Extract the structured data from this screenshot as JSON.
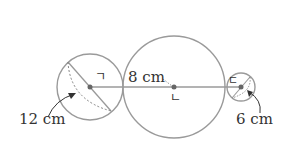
{
  "diagram": {
    "labels": {
      "left_diameter": "12 cm",
      "middle_distance": "8 cm",
      "right_diameter": "6 cm",
      "point_a": "ㄱ",
      "point_b": "ㄴ",
      "point_c": "ㄷ"
    },
    "circles": [
      {
        "name": "left-sphere",
        "cx": 90,
        "cy": 87,
        "r": 33
      },
      {
        "name": "middle-circle",
        "cx": 174,
        "cy": 87,
        "r": 51
      },
      {
        "name": "right-sphere",
        "cx": 241,
        "cy": 87,
        "r": 14
      }
    ],
    "colors": {
      "stroke": "#9a9a9a",
      "text": "#333333",
      "point": "#666666"
    }
  }
}
